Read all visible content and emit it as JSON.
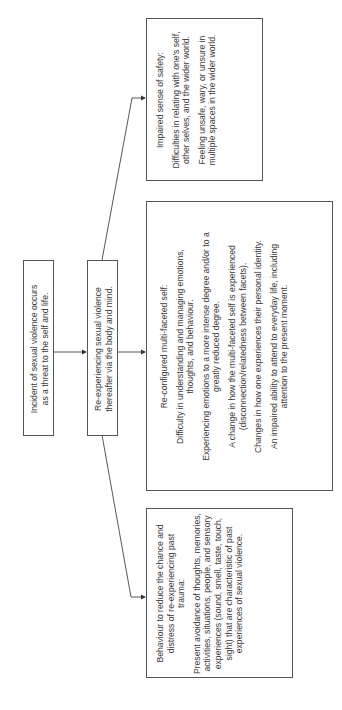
{
  "diagram": {
    "nodes": {
      "incident": {
        "lines": [
          "Incident of sexual violence occurs",
          "as a threat to the self and life."
        ]
      },
      "reexperiencing": {
        "lines": [
          "Re-experiencing sexual violence",
          "thereafter via the body and mind."
        ]
      },
      "safety": {
        "title": "Impaired sense of safety:",
        "items": [
          "Difficulties in relating with one's self, other selves, and the wider world.",
          "Feeling unsafe, wary, or unsure in multiple spaces in the wider world."
        ]
      },
      "self": {
        "title": "Re-configured multi-faceted self:",
        "items": [
          "Difficulty in understanding and managing emotions, thoughts, and behaviour.",
          "Experiencing emotions to a more intense degree and/or to a greatly reduced degree.",
          "A change in how the multi-faceted self is experienced (disconnection/relatedness between facets).",
          "Changes in how one experiences their personal identity.",
          "An impaired ability to attend to everyday life, including attention to the present moment."
        ]
      },
      "behaviour": {
        "title": "Behaviour to reduce the chance and distress of re-experiencing past trauma:",
        "items": [
          "Present avoidance of thoughts, memories, activities, situations, people, and sensory experiences (sound, smell, taste, touch, sight) that are characteristic of past experiences of sexual violence."
        ]
      }
    },
    "edges": [
      {
        "from": "incident",
        "to": "reexperiencing"
      },
      {
        "from": "reexperiencing",
        "to": "safety"
      },
      {
        "from": "reexperiencing",
        "to": "self"
      },
      {
        "from": "reexperiencing",
        "to": "behaviour"
      }
    ],
    "colors": {
      "stroke": "#555555",
      "text": "#3a3a3a"
    }
  }
}
